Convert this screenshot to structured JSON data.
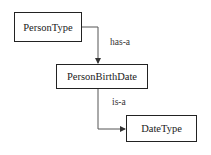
{
  "diagram": {
    "type": "relationship-diagram",
    "nodes": [
      {
        "id": "persontype",
        "label": "PersonType"
      },
      {
        "id": "personbirthdate",
        "label": "PersonBirthDate"
      },
      {
        "id": "datetype",
        "label": "DateType"
      }
    ],
    "edges": [
      {
        "from": "persontype",
        "to": "personbirthdate",
        "label": "has-a"
      },
      {
        "from": "personbirthdate",
        "to": "datetype",
        "label": "is-a"
      }
    ],
    "colors": {
      "line": "#555555",
      "border": "#222222",
      "background": "#ffffff"
    }
  }
}
